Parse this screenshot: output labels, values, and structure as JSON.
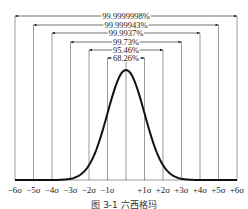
{
  "chart_data": {
    "type": "line",
    "title": "",
    "caption": "图 3-1 六西格玛",
    "xlabel": "",
    "ylabel": "",
    "x_ticks": [
      "−6σ",
      "−5σ",
      "−4σ",
      "−3σ",
      "−2σ",
      "−1σ",
      "",
      "+1σ",
      "+2σ",
      "+3σ",
      "+4σ",
      "+5σ",
      "+6σ"
    ],
    "curve": "normal distribution (bell curve), mean at center",
    "intervals": [
      {
        "range": "±1σ",
        "label": "68.26%"
      },
      {
        "range": "±2σ",
        "label": "95.46%"
      },
      {
        "range": "±3σ",
        "label": "99.73%"
      },
      {
        "range": "±4σ",
        "label": "99.9937%"
      },
      {
        "range": "±5σ",
        "label": "99.999943%"
      },
      {
        "range": "±6σ",
        "label": "99.9999998%"
      }
    ],
    "grid": "vertical lines at each sigma"
  }
}
